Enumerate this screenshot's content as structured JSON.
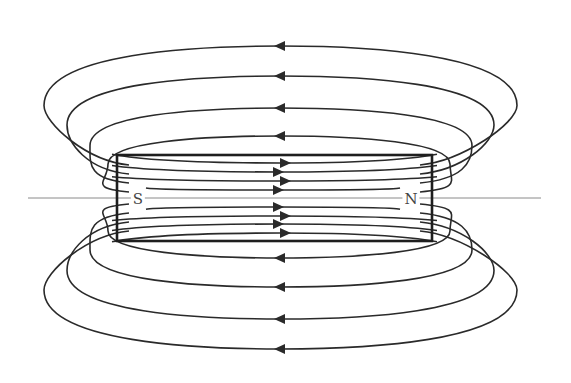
{
  "diagram": {
    "colors": {
      "line": "#2a2a2a",
      "axis": "#8a8a8a",
      "magnet": "#1e1e1e",
      "background": "#ffffff"
    },
    "axis": {
      "x1": 28,
      "x2": 541,
      "y": 198
    },
    "magnet": {
      "x": 117,
      "y": 155,
      "width": 315,
      "height": 86
    },
    "poles": [
      {
        "label": "S",
        "x": 138,
        "y": 199
      },
      {
        "label": "N",
        "x": 411,
        "y": 199
      }
    ],
    "outer_loops_top": [
      {
        "y_apex": 46,
        "left_x": 44,
        "right_x": 517,
        "arrow_x": 280
      },
      {
        "y_apex": 76,
        "left_x": 67,
        "right_x": 494,
        "arrow_x": 280
      },
      {
        "y_apex": 108,
        "left_x": 90,
        "right_x": 472,
        "arrow_x": 280
      },
      {
        "y_apex": 136,
        "left_x": 108,
        "right_x": 450,
        "arrow_x": 280
      }
    ],
    "outer_loops_bottom": [
      {
        "y_apex": 349,
        "left_x": 44,
        "right_x": 517,
        "arrow_x": 280
      },
      {
        "y_apex": 319,
        "left_x": 67,
        "right_x": 494,
        "arrow_x": 280
      },
      {
        "y_apex": 287,
        "left_x": 90,
        "right_x": 472,
        "arrow_x": 280
      },
      {
        "y_apex": 258,
        "left_x": 108,
        "right_x": 450,
        "arrow_x": 280
      }
    ],
    "inner_lines": [
      {
        "y": 163,
        "arrow_x": 285
      },
      {
        "y": 172,
        "arrow_x": 278
      },
      {
        "y": 181,
        "arrow_x": 285
      },
      {
        "y": 190,
        "arrow_x": 278
      },
      {
        "y": 207,
        "arrow_x": 278
      },
      {
        "y": 216,
        "arrow_x": 285
      },
      {
        "y": 224,
        "arrow_x": 278
      },
      {
        "y": 233,
        "arrow_x": 285
      }
    ],
    "direction": {
      "inside": "S to N (right)",
      "outside": "N to S (left)"
    }
  }
}
